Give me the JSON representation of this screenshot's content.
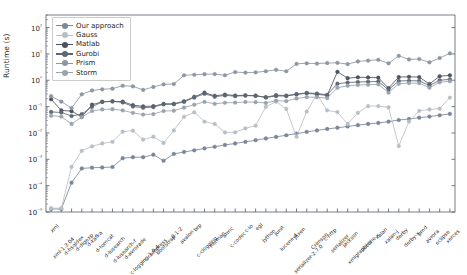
{
  "chart_data": {
    "type": "line",
    "title": "",
    "xlabel": "",
    "ylabel": "Runtime (s)",
    "yscale": "log",
    "ylim": [
      1e-05,
      300
    ],
    "grid": false,
    "legend_position": "upper left",
    "ytick_labels": [
      "10²",
      "10¹",
      "10⁰",
      "10⁻¹",
      "10⁻²",
      "10⁻³",
      "10⁻⁴",
      "10⁻⁵"
    ],
    "ytick_values": [
      100,
      10,
      1,
      0.1,
      0.01,
      0.001,
      0.0001,
      1e-05
    ],
    "categories": [
      "xml",
      "xml-1.3.04",
      "d-hsqldex",
      "d-digexp",
      "d-kafka",
      "d-tomcat",
      "d-lusearch",
      "d-lusearch-f",
      "d-avrorade",
      "c-logging-1.0.4",
      "c-compress",
      "bootstrap",
      "0-1-2",
      "avalon",
      "brp",
      "c-clogging",
      "herman",
      "armc",
      "c-codec",
      "c-io",
      "egl",
      "jython",
      "junit",
      "lucene-4",
      "jexen",
      "serializer-2.7.0",
      "Crimson",
      "c-http",
      "serializer",
      "jackson",
      "xmlgraphics",
      "lucene-x",
      "xalan",
      "xalan-j",
      "derby",
      "derby-x",
      "pmd",
      "avrora",
      "eclipse",
      "xerces"
    ],
    "series": [
      {
        "name": "Our approach",
        "color": "#7a8799",
        "values": [
          1.3e-05,
          1.3e-05,
          0.00013,
          0.00045,
          0.00048,
          0.00049,
          0.00051,
          0.0011,
          0.0012,
          0.0012,
          0.0015,
          0.00088,
          0.0016,
          0.0019,
          0.0022,
          0.0026,
          0.003,
          0.0035,
          0.004,
          0.0046,
          0.0053,
          0.0062,
          0.0071,
          0.0082,
          0.0094,
          0.011,
          0.0125,
          0.0142,
          0.0158,
          0.0176,
          0.0198,
          0.022,
          0.024,
          0.027,
          0.031,
          0.034,
          0.038,
          0.042,
          0.047,
          0.053
        ]
      },
      {
        "name": "Gauss",
        "color": "#b9bfc6",
        "values": [
          1.4e-05,
          1.4e-05,
          0.00052,
          0.0021,
          0.0031,
          0.004,
          0.0046,
          0.0112,
          0.0122,
          0.0056,
          0.0072,
          0.0042,
          0.0125,
          0.041,
          0.061,
          0.027,
          0.022,
          0.0105,
          0.0106,
          0.015,
          0.019,
          0.098,
          0.155,
          0.082,
          0.0072,
          0.065,
          0.29,
          0.072,
          0.062,
          0.022,
          0.058,
          0.105,
          0.105,
          0.094,
          0.0032,
          0.027,
          0.069,
          0.078,
          0.084,
          0.22
        ]
      },
      {
        "name": "Matlab",
        "color": "#4b5360",
        "values": [
          0.19,
          0.072,
          0.067,
          0.041,
          0.118,
          0.152,
          0.158,
          0.155,
          0.113,
          0.102,
          0.104,
          0.127,
          0.128,
          0.16,
          0.236,
          0.338,
          0.258,
          0.285,
          0.264,
          0.268,
          0.261,
          0.222,
          0.255,
          0.253,
          0.292,
          0.322,
          0.295,
          0.266,
          2.1,
          1.2,
          1.3,
          1.28,
          1.25,
          0.5,
          1.32,
          1.35,
          1.32,
          0.72,
          1.42,
          1.55
        ]
      },
      {
        "name": "Gurobi",
        "color": "#5c6775",
        "values": [
          0.063,
          0.06,
          0.044,
          0.052,
          0.098,
          0.152,
          0.16,
          0.144,
          0.101,
          0.091,
          0.096,
          0.122,
          0.123,
          0.152,
          0.22,
          0.308,
          0.238,
          0.266,
          0.25,
          0.262,
          0.256,
          0.228,
          0.272,
          0.262,
          0.298,
          0.33,
          0.315,
          0.282,
          0.74,
          0.82,
          0.86,
          0.88,
          0.9,
          0.44,
          0.94,
          0.96,
          0.95,
          0.63,
          1.0,
          1.08
        ]
      },
      {
        "name": "Prism",
        "color": "#8d96a3",
        "values": [
          0.25,
          0.155,
          0.088,
          0.295,
          0.41,
          0.455,
          0.48,
          0.62,
          0.59,
          0.43,
          0.56,
          0.7,
          0.72,
          1.55,
          1.62,
          1.7,
          1.72,
          1.55,
          2.05,
          1.95,
          2.0,
          2.2,
          2.5,
          2.2,
          4.2,
          4.4,
          4.3,
          4.5,
          4.6,
          4.1,
          5.2,
          5.6,
          6.0,
          4.4,
          8.5,
          6.2,
          6.4,
          4.8,
          7.0,
          10.5
        ]
      },
      {
        "name": "Storm",
        "color": "#9aa3ae",
        "values": [
          0.045,
          0.042,
          0.022,
          0.04,
          0.068,
          0.078,
          0.08,
          0.072,
          0.058,
          0.05,
          0.052,
          0.068,
          0.07,
          0.092,
          0.118,
          0.152,
          0.128,
          0.14,
          0.142,
          0.15,
          0.148,
          0.138,
          0.168,
          0.162,
          0.205,
          0.23,
          0.228,
          0.21,
          0.52,
          0.62,
          0.66,
          0.68,
          0.7,
          0.34,
          0.74,
          0.78,
          0.78,
          0.52,
          0.84,
          0.92
        ]
      }
    ]
  },
  "axes": {
    "left": 46,
    "right": 455,
    "top": 15,
    "bottom": 212
  }
}
